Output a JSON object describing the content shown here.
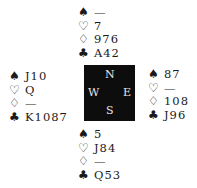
{
  "suits": {
    "spades": "♠",
    "hearts": "♡",
    "diamonds": "♢",
    "clubs": "♣"
  },
  "compass": {
    "north": "N",
    "south": "S",
    "west": "W",
    "east": "E"
  },
  "hands": {
    "north": {
      "spades": "—",
      "hearts": "7",
      "diamonds": "976",
      "clubs": "A42"
    },
    "west": {
      "spades": "J10",
      "hearts": "Q",
      "diamonds": "—",
      "clubs": "K1087"
    },
    "east": {
      "spades": "87",
      "hearts": "—",
      "diamonds": "108",
      "clubs": "J96"
    },
    "south": {
      "spades": "5",
      "hearts": "J84",
      "diamonds": "—",
      "clubs": "Q53"
    }
  }
}
